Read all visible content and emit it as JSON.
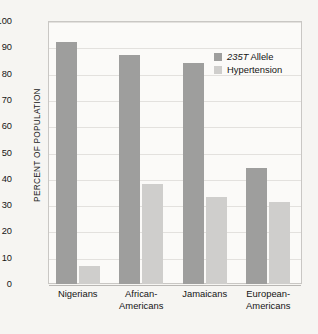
{
  "chart_data": {
    "type": "bar",
    "title": "",
    "subtitle": "",
    "xlabel": "",
    "ylabel": "PERCENT OF POPULATION",
    "ylim": [
      0,
      100
    ],
    "ytick_step": 10,
    "yticks": [
      100,
      90,
      80,
      70,
      60,
      50,
      40,
      30,
      20,
      10,
      0
    ],
    "grid": true,
    "legend_position": "inside top-right",
    "categories": [
      "Nigerians",
      "African-Americans",
      "Jamaicans",
      "European-Americans"
    ],
    "category_lines": [
      [
        "Nigerians",
        ""
      ],
      [
        "African-",
        "Americans"
      ],
      [
        "Jamaicans",
        ""
      ],
      [
        "European-",
        "Americans"
      ]
    ],
    "series": [
      {
        "name": "235T Allele",
        "name_italic_part": "235T",
        "name_plain_part": " Allele",
        "color": "#9e9e9d",
        "values": [
          92,
          87,
          84,
          44
        ]
      },
      {
        "name": "Hypertension",
        "color": "#cfcecc",
        "values": [
          7,
          38,
          33,
          31
        ]
      }
    ],
    "annotations": []
  },
  "colors": {
    "page_background": "#f6f5f2",
    "plot_background": "#fbfaf8",
    "plot_border": "#c9c7c4",
    "gridline": "#e3e1de",
    "baseline": "#b9b7b4",
    "text": "#141414",
    "series_allele": "#9e9e9d",
    "series_hypertension": "#cfcecc"
  }
}
